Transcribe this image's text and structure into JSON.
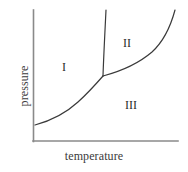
{
  "figure": {
    "title": "",
    "background_color": "#ffffff",
    "width": 188,
    "height": 172
  },
  "axes": {
    "x_label": "temperature",
    "y_label": "pressure",
    "line_color": "#8a8a8a",
    "origin_x": 33,
    "origin_y": 141,
    "x_end": 178,
    "y_top": 10,
    "ticks": [],
    "gridlines": false
  },
  "regions": [
    {
      "id": "region-1",
      "label": "I",
      "x": 64,
      "y": 67
    },
    {
      "id": "region-2",
      "label": "II",
      "x": 127,
      "y": 43
    },
    {
      "id": "region-3",
      "label": "III",
      "x": 131,
      "y": 105
    }
  ],
  "curves": [
    {
      "id": "sublimation-curve",
      "name": "sublimation-curve",
      "color": "#3a3a3a",
      "width": 1.2,
      "path": "M 35 125 C 50 121, 66 113, 78 102 C 88 93, 96 84, 103 76"
    },
    {
      "id": "fusion-curve",
      "name": "fusion-curve",
      "color": "#3a3a3a",
      "width": 1.2,
      "path": "M 103 76 C 103.5 60, 104.5 40, 106 10"
    },
    {
      "id": "vaporization-curve",
      "name": "vaporization-curve",
      "color": "#3a3a3a",
      "width": 1.2,
      "path": "M 103 76 C 118 72, 138 64, 152 52 C 164 41, 171 25, 175 10"
    }
  ],
  "triple_point": {
    "x": 103,
    "y": 76
  },
  "chart_data": {
    "type": "line",
    "title": "",
    "xlabel": "temperature",
    "ylabel": "pressure",
    "xlim": [
      0,
      1
    ],
    "ylim": [
      0,
      1
    ],
    "grid": false,
    "legend": "none",
    "annotations": [
      "I",
      "II",
      "III"
    ],
    "series": [
      {
        "name": "sublimation-curve",
        "points": [
          [
            35,
            125
          ],
          [
            48,
            121
          ],
          [
            60,
            115
          ],
          [
            72,
            107
          ],
          [
            84,
            96
          ],
          [
            94,
            86
          ],
          [
            103,
            76
          ]
        ]
      },
      {
        "name": "fusion-curve",
        "points": [
          [
            103,
            76
          ],
          [
            103.5,
            62
          ],
          [
            104,
            48
          ],
          [
            105,
            30
          ],
          [
            106,
            10
          ]
        ]
      },
      {
        "name": "vaporization-curve",
        "points": [
          [
            103,
            76
          ],
          [
            116,
            72
          ],
          [
            130,
            67
          ],
          [
            143,
            59
          ],
          [
            155,
            49
          ],
          [
            165,
            35
          ],
          [
            171,
            22
          ],
          [
            175,
            10
          ]
        ]
      }
    ]
  }
}
